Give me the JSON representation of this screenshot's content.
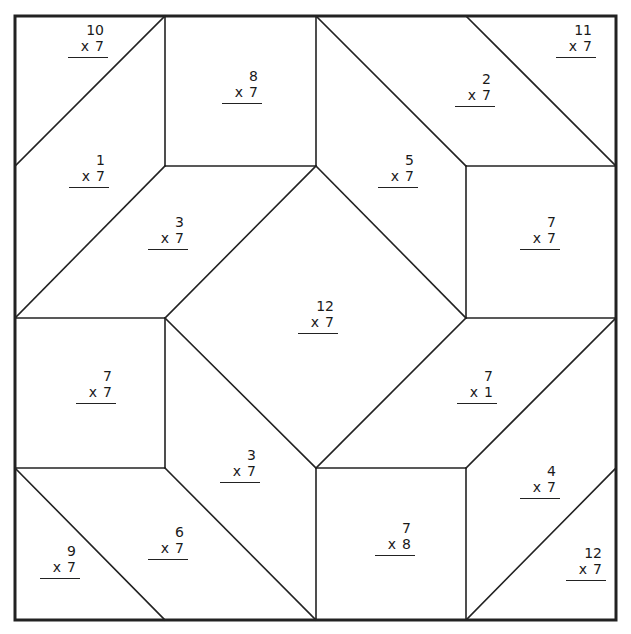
{
  "worksheet": {
    "title": "Multiplication by 7 quilt",
    "line_color": "#222222",
    "frame": {
      "x1": 15,
      "y1": 16,
      "x2": 616,
      "y2": 620
    },
    "problems": [
      {
        "id": "p1",
        "top": "10",
        "op": "x",
        "bottom": "7",
        "x": 68,
        "y": 22
      },
      {
        "id": "p2",
        "top": "8",
        "op": "x",
        "bottom": "7",
        "x": 222,
        "y": 68
      },
      {
        "id": "p3",
        "top": "2",
        "op": "x",
        "bottom": "7",
        "x": 455,
        "y": 71
      },
      {
        "id": "p4",
        "top": "11",
        "op": "x",
        "bottom": "7",
        "x": 556,
        "y": 22
      },
      {
        "id": "p5",
        "top": "1",
        "op": "x",
        "bottom": "7",
        "x": 69,
        "y": 152
      },
      {
        "id": "p6",
        "top": "5",
        "op": "x",
        "bottom": "7",
        "x": 378,
        "y": 152
      },
      {
        "id": "p7",
        "top": "3",
        "op": "x",
        "bottom": "7",
        "x": 148,
        "y": 214
      },
      {
        "id": "p8",
        "top": "7",
        "op": "x",
        "bottom": "7",
        "x": 520,
        "y": 214
      },
      {
        "id": "p9",
        "top": "12",
        "op": "x",
        "bottom": "7",
        "x": 298,
        "y": 298
      },
      {
        "id": "p10",
        "top": "7",
        "op": "x",
        "bottom": "7",
        "x": 76,
        "y": 368
      },
      {
        "id": "p11",
        "top": "7",
        "op": "x",
        "bottom": "1",
        "x": 457,
        "y": 368
      },
      {
        "id": "p12",
        "top": "3",
        "op": "x",
        "bottom": "7",
        "x": 220,
        "y": 447
      },
      {
        "id": "p13",
        "top": "4",
        "op": "x",
        "bottom": "7",
        "x": 520,
        "y": 463
      },
      {
        "id": "p14",
        "top": "6",
        "op": "x",
        "bottom": "7",
        "x": 148,
        "y": 524
      },
      {
        "id": "p15",
        "top": "7",
        "op": "x",
        "bottom": "8",
        "x": 375,
        "y": 520
      },
      {
        "id": "p16",
        "top": "9",
        "op": "x",
        "bottom": "7",
        "x": 40,
        "y": 543
      },
      {
        "id": "p17",
        "top": "12",
        "op": "x",
        "bottom": "7",
        "x": 566,
        "y": 545
      }
    ]
  }
}
